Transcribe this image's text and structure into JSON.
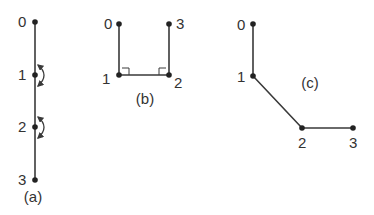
{
  "diagrams": {
    "a": {
      "caption": "(a)",
      "description": "straight vertical chain with rotation arrows at joints 1 and 2",
      "joints": [
        {
          "label": "0",
          "x": 35,
          "y": 22
        },
        {
          "label": "1",
          "x": 35,
          "y": 75
        },
        {
          "label": "2",
          "x": 35,
          "y": 127
        },
        {
          "label": "3",
          "x": 35,
          "y": 180
        }
      ],
      "rotation_arrows_at": [
        "1",
        "2"
      ]
    },
    "b": {
      "caption": "(b)",
      "description": "U-shaped chain with right angles at joints 1 and 2",
      "joints": [
        {
          "label": "0",
          "x": 119,
          "y": 24
        },
        {
          "label": "1",
          "x": 119,
          "y": 75
        },
        {
          "label": "2",
          "x": 169,
          "y": 75
        },
        {
          "label": "3",
          "x": 169,
          "y": 24
        }
      ],
      "right_angle_marks_at": [
        "1",
        "2"
      ]
    },
    "c": {
      "caption": "(c)",
      "description": "bent chain: vertical, diagonal, horizontal links",
      "joints": [
        {
          "label": "0",
          "x": 253,
          "y": 24
        },
        {
          "label": "1",
          "x": 253,
          "y": 76
        },
        {
          "label": "2",
          "x": 302,
          "y": 128
        },
        {
          "label": "3",
          "x": 353,
          "y": 128
        }
      ]
    }
  }
}
